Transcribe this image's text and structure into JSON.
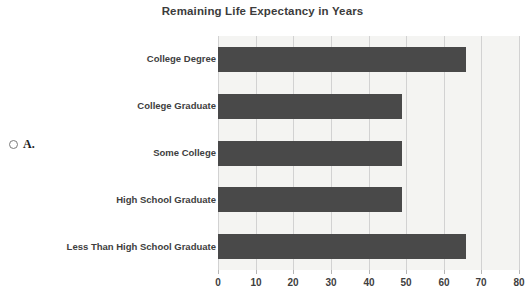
{
  "question": {
    "choice_letter": "A.",
    "radio_state": "unselected"
  },
  "chart_data": {
    "type": "bar",
    "orientation": "horizontal",
    "title": "Remaining Life Expectancy in Years",
    "xlabel": "",
    "ylabel": "",
    "categories": [
      "College Degree",
      "College Graduate",
      "Some College",
      "High School Graduate",
      "Less Than High School Graduate"
    ],
    "values": [
      66,
      49,
      49,
      49,
      66
    ],
    "xlim": [
      0,
      80
    ],
    "xticks": [
      0,
      10,
      20,
      30,
      40,
      50,
      60,
      70,
      80
    ],
    "xtick_labels": [
      "0",
      "10",
      "20",
      "30",
      "40",
      "50",
      "60",
      "70",
      "80"
    ],
    "grid": "vertical",
    "legend": "none",
    "bar_color": "#494949",
    "band_color": "#f4f4f2",
    "gridline_color": "#d2d2d2",
    "plot_background": "#ffffff"
  }
}
